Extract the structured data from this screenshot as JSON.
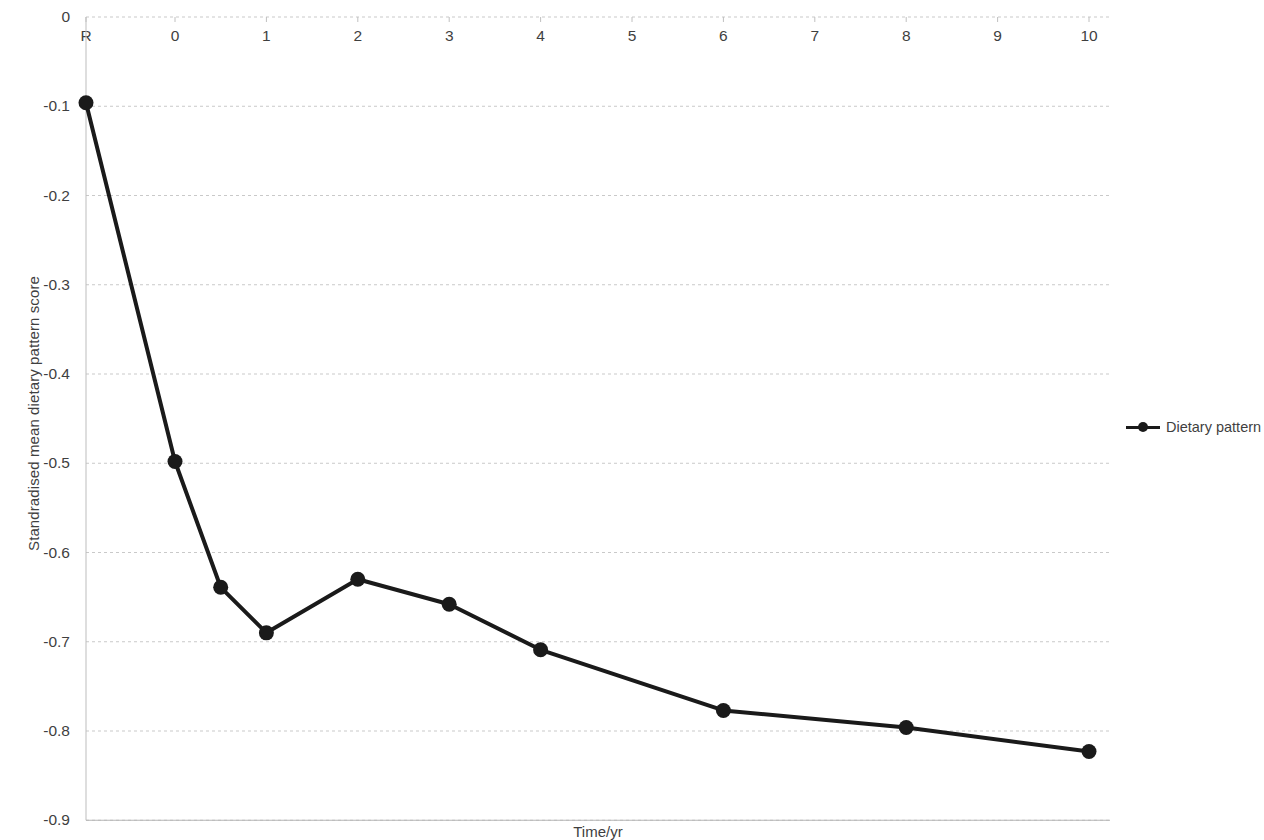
{
  "chart_data": {
    "type": "line",
    "title": "",
    "xlabel": "Time/yr",
    "ylabel": "Standradised mean dietary pattern score",
    "x_tick_labels": [
      "R",
      "0",
      "1",
      "2",
      "3",
      "4",
      "5",
      "6",
      "7",
      "8",
      "9",
      "10"
    ],
    "y_tick_labels": [
      "0",
      "-0.1",
      "-0.2",
      "-0.3",
      "-0.4",
      "-0.5",
      "-0.6",
      "-0.7",
      "-0.8",
      "-0.9"
    ],
    "ylim": [
      -0.9,
      0
    ],
    "xlim": [
      "R",
      10
    ],
    "grid": true,
    "legend_position": "right",
    "series": [
      {
        "name": "Dietary pattern",
        "color": "#1a1a1a",
        "marker": "circle",
        "x": [
          "R",
          0,
          0.5,
          1,
          2,
          3,
          4,
          6,
          8,
          10
        ],
        "values": [
          -0.096,
          -0.498,
          -0.639,
          -0.69,
          -0.63,
          -0.658,
          -0.709,
          -0.777,
          -0.796,
          -0.823
        ]
      }
    ]
  },
  "legend": {
    "entries": [
      {
        "label": "Dietary pattern"
      }
    ]
  },
  "axes": {
    "x_title": "Time/yr",
    "y_title": "Standradised mean dietary pattern score"
  }
}
